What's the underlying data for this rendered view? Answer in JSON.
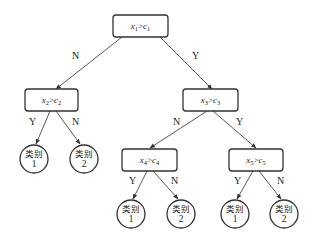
{
  "diagram": {
    "type": "decision-tree",
    "nodes": {
      "root": {
        "var": "x",
        "sub": "1",
        "op": ">",
        "cvar": "c",
        "csub": "1"
      },
      "n2": {
        "var": "x",
        "sub": "2",
        "op": ">",
        "cvar": "c",
        "csub": "2"
      },
      "n3": {
        "var": "x",
        "sub": "3",
        "op": ">",
        "cvar": "c",
        "csub": "3"
      },
      "n4": {
        "var": "x",
        "sub": "4",
        "op": ">",
        "cvar": "c",
        "csub": "4"
      },
      "n5": {
        "var": "x",
        "sub": "5",
        "op": ">",
        "cvar": "c",
        "csub": "5"
      }
    },
    "leaves": [
      {
        "label": "类别",
        "num": "1"
      },
      {
        "label": "类别",
        "num": "2"
      },
      {
        "label": "类别",
        "num": "1"
      },
      {
        "label": "类别",
        "num": "2"
      },
      {
        "label": "类别",
        "num": "1"
      },
      {
        "label": "类别",
        "num": "2"
      }
    ],
    "edges": {
      "root_left": "N",
      "root_right": "Y",
      "n2_left": "Y",
      "n2_right": "N",
      "n3_left": "N",
      "n3_right": "Y",
      "n4_left": "Y",
      "n4_right": "N",
      "n5_left": "Y",
      "n5_right": "N"
    }
  }
}
